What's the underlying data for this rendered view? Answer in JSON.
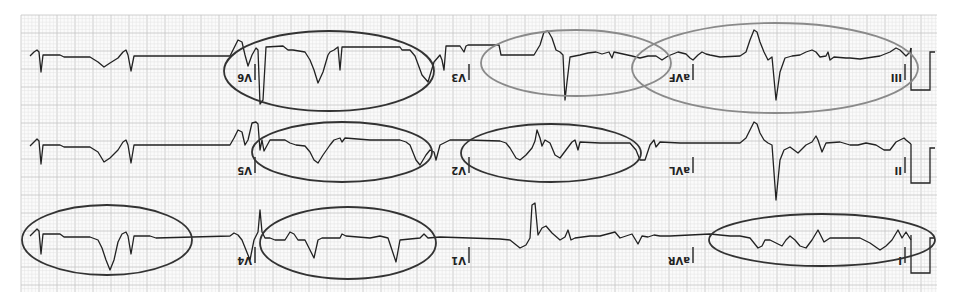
{
  "figure": {
    "orientation": "upside-down",
    "grid": {
      "minor_color": "#e2e2e2",
      "major_color": "#c4c4c4",
      "paper_color": "#fbfbfb"
    },
    "trace_color": "#222222",
    "annotation_colors": {
      "dark": "#333333",
      "gray": "#8a8a8a"
    }
  },
  "rows": [
    {
      "leads": [
        {
          "label": "III",
          "annotated": true,
          "annotation_color": "gray"
        },
        {
          "label": "aVF",
          "annotated": true,
          "annotation_color": "gray"
        },
        {
          "label": "V3",
          "annotated": true,
          "annotation_color": "gray"
        },
        {
          "label": "V6",
          "annotated": true,
          "annotation_color": "dark"
        }
      ],
      "calibration_pulse": true
    },
    {
      "leads": [
        {
          "label": "II",
          "annotated": false
        },
        {
          "label": "aVL",
          "annotated": false
        },
        {
          "label": "V2",
          "annotated": true,
          "annotation_color": "dark"
        },
        {
          "label": "V5",
          "annotated": true,
          "annotation_color": "dark"
        }
      ],
      "calibration_pulse": true
    },
    {
      "leads": [
        {
          "label": "I",
          "annotated": true,
          "annotation_color": "dark"
        },
        {
          "label": "aVR",
          "annotated": false
        },
        {
          "label": "V1",
          "annotated": false
        },
        {
          "label": "V4",
          "annotated": true,
          "annotation_color": "dark"
        }
      ],
      "calibration_pulse": true
    }
  ],
  "ellipse_count": 9
}
